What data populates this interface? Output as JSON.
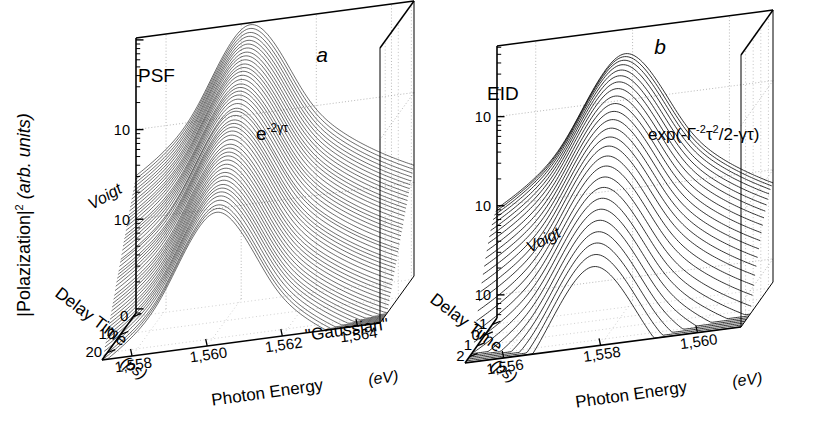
{
  "figure": {
    "kind": "two-panel 3D waterfall log-scale plot",
    "shared_y_axis_label_main": "|Polazization|",
    "shared_y_axis_label_exp": "2",
    "shared_y_axis_label_units": "(arb. units)"
  },
  "panels": [
    {
      "id": "panel-a",
      "letter": "a",
      "name": "PSF",
      "model_annotation": "e",
      "model_annotation_exp": "-2γτ",
      "lineshape_label": "Voigt",
      "extra_label": "\"Gaussian\"",
      "y_ticks": [
        "10",
        "10"
      ],
      "y_tick_exps": [
        "-1",
        "-2"
      ],
      "y_axis_label_main": "|Polazization|",
      "y_axis_label_exp": "2",
      "y_axis_label_units": "(arb. units)",
      "delay_axis_title": "Delay Time",
      "delay_axis_units": "(ps)",
      "delay_ticks": [
        "0",
        "10",
        "20"
      ],
      "energy_axis_title": "Photon Energy",
      "energy_axis_units": "(eV)",
      "energy_ticks": [
        "1,558",
        "1,560",
        "1,562",
        "1,564"
      ]
    },
    {
      "id": "panel-b",
      "letter": "b",
      "name": "EID",
      "model_annotation": "exp(-Γ",
      "model_annotation_exp1": "-2",
      "model_annotation_mid": "τ",
      "model_annotation_exp2": "2",
      "model_annotation_tail": "/2-γτ)",
      "lineshape_label": "Voigt",
      "y_ticks": [
        "10",
        "10",
        "10"
      ],
      "y_tick_exps": [
        "-1",
        "-2",
        "-3"
      ],
      "delay_axis_title": "Delay Time",
      "delay_axis_units": "(ps)",
      "delay_ticks": [
        "-1",
        "0",
        "1",
        "2"
      ],
      "energy_axis_title": "Photon Energy",
      "energy_axis_units": "(eV)",
      "energy_ticks": [
        "1,556",
        "1,558",
        "1,560"
      ]
    }
  ],
  "chart_data": {
    "type": "line",
    "title": "",
    "subtitle": "",
    "panels": [
      {
        "label": "a",
        "name": "PSF",
        "xlabel": "Photon Energy (eV)",
        "zlabel": "Delay Time (ps)",
        "ylabel": "|Polazization|^2 (arb. units)",
        "yscale": "log",
        "ylim": [
          0.0008,
          1.0
        ],
        "ytick_values": [
          0.1,
          0.01
        ],
        "ytick_labels": [
          "10^-1",
          "10^-2"
        ],
        "xlim": [
          1557.2,
          1564.6
        ],
        "xtick_values": [
          1558,
          1560,
          1562,
          1564
        ],
        "xtick_labels": [
          "1,558",
          "1,560",
          "1,562",
          "1,564"
        ],
        "zlim": [
          -2,
          24
        ],
        "ztick_values": [
          0,
          10,
          20
        ],
        "ztick_labels": [
          "0",
          "10",
          "20"
        ],
        "grid": true,
        "n_traces": 48,
        "trace_peak_energy_eV": 1560.3,
        "trace_linewidth_eV": 0.75,
        "lineshape": "Voigt",
        "decay_law": "e^(-2γτ)",
        "annotations": [
          "PSF",
          "e^-2γτ",
          "Voigt",
          "\"Gaussian\""
        ],
        "peak_amplitudes": [
          1.0,
          0.93,
          0.86,
          0.8,
          0.74,
          0.69,
          0.64,
          0.59,
          0.55,
          0.51,
          0.47,
          0.44,
          0.41,
          0.38,
          0.35,
          0.32,
          0.3,
          0.28,
          0.26,
          0.24,
          0.22,
          0.2,
          0.19,
          0.175,
          0.16,
          0.15,
          0.14,
          0.13,
          0.12,
          0.11,
          0.1,
          0.093,
          0.086,
          0.08,
          0.074,
          0.068,
          0.063,
          0.058,
          0.054,
          0.05,
          0.046,
          0.043,
          0.04,
          0.037,
          0.034,
          0.031,
          0.029,
          0.027
        ]
      },
      {
        "label": "b",
        "name": "EID",
        "xlabel": "Photon Energy (eV)",
        "zlabel": "Delay Time (ps)",
        "ylabel": "|Polazization|^2 (arb. units)",
        "yscale": "log",
        "ylim": [
          0.0005,
          0.6
        ],
        "ytick_values": [
          0.1,
          0.01,
          0.001
        ],
        "ytick_labels": [
          "10^-1",
          "10^-2",
          "10^-3"
        ],
        "xlim": [
          1555.2,
          1560.9
        ],
        "xtick_values": [
          1556,
          1558,
          1560
        ],
        "xtick_labels": [
          "1,556",
          "1,558",
          "1,560"
        ],
        "zlim": [
          -1.6,
          2.6
        ],
        "ztick_values": [
          -1,
          0,
          1,
          2
        ],
        "ztick_labels": [
          "-1",
          "0",
          "1",
          "2"
        ],
        "grid": true,
        "n_traces": 26,
        "trace_peak_energy_eV": 1557.9,
        "trace_linewidth_eV": 0.62,
        "lineshape": "Voigt",
        "decay_law": "exp(-Γ^-2τ^2/2-γτ)",
        "annotations": [
          "EID",
          "exp(-Γ^-2τ^2/2-γτ)",
          "Voigt"
        ],
        "peak_amplitudes": [
          0.33,
          0.32,
          0.305,
          0.285,
          0.26,
          0.235,
          0.21,
          0.185,
          0.16,
          0.138,
          0.118,
          0.1,
          0.084,
          0.07,
          0.058,
          0.047,
          0.038,
          0.03,
          0.024,
          0.019,
          0.015,
          0.0118,
          0.0092,
          0.0072,
          0.0056,
          0.0043
        ]
      }
    ]
  }
}
